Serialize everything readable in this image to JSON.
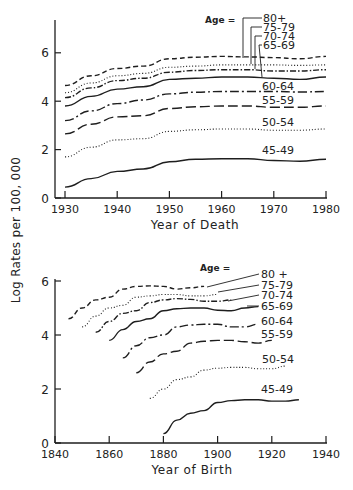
{
  "figure": {
    "ylabel": "Log Rates per 100, 000"
  },
  "chart_data": [
    {
      "type": "line",
      "title": "",
      "xlabel": "Year of Death",
      "ylabel": "Log Rates per 100, 000",
      "xlim": [
        1930,
        1980
      ],
      "ylim": [
        0,
        7.3
      ],
      "xticks": [
        1930,
        1940,
        1950,
        1960,
        1970,
        1980
      ],
      "yticks": [
        0,
        2,
        4,
        6
      ],
      "grid": false,
      "legend_title": "Age =",
      "series": [
        {
          "name": "80+",
          "style": "dashed",
          "x": [
            1930,
            1935,
            1940,
            1945,
            1950,
            1955,
            1960,
            1965,
            1970,
            1975,
            1980
          ],
          "y": [
            4.65,
            5.05,
            5.35,
            5.45,
            5.75,
            5.82,
            5.85,
            5.83,
            5.8,
            5.75,
            5.85
          ]
        },
        {
          "name": "75-79",
          "style": "dotted",
          "x": [
            1930,
            1935,
            1940,
            1945,
            1950,
            1955,
            1960,
            1965,
            1970,
            1975,
            1980
          ],
          "y": [
            4.35,
            4.75,
            5.05,
            5.15,
            5.4,
            5.45,
            5.5,
            5.5,
            5.5,
            5.48,
            5.5
          ]
        },
        {
          "name": "70-74",
          "style": "dashdot",
          "x": [
            1930,
            1935,
            1940,
            1945,
            1950,
            1955,
            1960,
            1965,
            1970,
            1975,
            1980
          ],
          "y": [
            4.15,
            4.55,
            4.85,
            4.95,
            5.2,
            5.27,
            5.3,
            5.3,
            5.25,
            5.25,
            5.3
          ]
        },
        {
          "name": "65-69",
          "style": "solid",
          "x": [
            1930,
            1935,
            1940,
            1945,
            1950,
            1955,
            1960,
            1965,
            1970,
            1975,
            1980
          ],
          "y": [
            3.8,
            4.2,
            4.5,
            4.6,
            4.9,
            4.95,
            5.0,
            5.0,
            4.95,
            4.9,
            5.0
          ]
        },
        {
          "name": "60-64",
          "style": "longdashdot",
          "x": [
            1930,
            1935,
            1940,
            1945,
            1950,
            1955,
            1960,
            1965,
            1970,
            1975,
            1980
          ],
          "y": [
            3.2,
            3.6,
            3.9,
            4.05,
            4.3,
            4.37,
            4.4,
            4.4,
            4.4,
            4.38,
            4.4
          ]
        },
        {
          "name": "55-59",
          "style": "longdash",
          "x": [
            1930,
            1935,
            1940,
            1945,
            1950,
            1955,
            1960,
            1965,
            1970,
            1975,
            1980
          ],
          "y": [
            2.65,
            3.05,
            3.35,
            3.4,
            3.7,
            3.77,
            3.8,
            3.8,
            3.75,
            3.75,
            3.8
          ]
        },
        {
          "name": "50-54",
          "style": "dotted",
          "x": [
            1930,
            1935,
            1940,
            1945,
            1950,
            1955,
            1960,
            1965,
            1970,
            1975,
            1980
          ],
          "y": [
            1.7,
            2.1,
            2.4,
            2.45,
            2.75,
            2.82,
            2.85,
            2.85,
            2.8,
            2.8,
            2.85
          ]
        },
        {
          "name": "45-49",
          "style": "solid",
          "x": [
            1930,
            1935,
            1940,
            1945,
            1950,
            1955,
            1960,
            1965,
            1970,
            1975,
            1980
          ],
          "y": [
            0.45,
            0.8,
            1.1,
            1.2,
            1.5,
            1.6,
            1.62,
            1.62,
            1.55,
            1.52,
            1.6
          ]
        }
      ]
    },
    {
      "type": "line",
      "title": "",
      "xlabel": "Year of Birth",
      "ylabel": "Log Rates per 100, 000",
      "xlim": [
        1840,
        1940
      ],
      "ylim": [
        0,
        6.1
      ],
      "xticks": [
        1840,
        1860,
        1880,
        1900,
        1920,
        1940
      ],
      "yticks": [
        0,
        2,
        4,
        6
      ],
      "grid": false,
      "legend_title": "Age =",
      "series": [
        {
          "name": "80 +",
          "style": "dashed",
          "x": [
            1845,
            1850,
            1855,
            1860,
            1865,
            1870,
            1875,
            1880,
            1885,
            1890,
            1895
          ],
          "y": [
            4.6,
            5.0,
            5.3,
            5.4,
            5.7,
            5.8,
            5.82,
            5.8,
            5.7,
            5.75,
            5.8
          ]
        },
        {
          "name": "75-79",
          "style": "dotted",
          "x": [
            1850,
            1855,
            1860,
            1865,
            1870,
            1875,
            1880,
            1885,
            1890,
            1895,
            1900
          ],
          "y": [
            4.3,
            4.7,
            5.0,
            5.1,
            5.4,
            5.45,
            5.5,
            5.5,
            5.45,
            5.45,
            5.5
          ]
        },
        {
          "name": "70-74",
          "style": "dashdot",
          "x": [
            1855,
            1860,
            1865,
            1870,
            1875,
            1880,
            1885,
            1890,
            1895,
            1900,
            1905
          ],
          "y": [
            4.1,
            4.5,
            4.8,
            4.9,
            5.2,
            5.3,
            5.35,
            5.32,
            5.25,
            5.25,
            5.3
          ]
        },
        {
          "name": "65-69",
          "style": "solid",
          "x": [
            1860,
            1865,
            1870,
            1875,
            1880,
            1885,
            1890,
            1895,
            1900,
            1905,
            1910,
            1915
          ],
          "y": [
            3.8,
            4.2,
            4.5,
            4.6,
            4.9,
            4.97,
            5.0,
            5.0,
            4.92,
            4.9,
            5.0,
            5.05
          ]
        },
        {
          "name": "60-64",
          "style": "longdashdot",
          "x": [
            1865,
            1870,
            1875,
            1880,
            1885,
            1890,
            1895,
            1900,
            1905,
            1910,
            1915
          ],
          "y": [
            3.15,
            3.6,
            3.9,
            4.0,
            4.3,
            4.37,
            4.4,
            4.4,
            4.3,
            4.3,
            4.4
          ]
        },
        {
          "name": "55-59",
          "style": "longdash",
          "x": [
            1870,
            1875,
            1880,
            1885,
            1890,
            1895,
            1900,
            1905,
            1910,
            1915,
            1920
          ],
          "y": [
            2.6,
            3.0,
            3.3,
            3.4,
            3.7,
            3.77,
            3.8,
            3.8,
            3.75,
            3.7,
            3.8
          ]
        },
        {
          "name": "50-54",
          "style": "dotted",
          "x": [
            1875,
            1880,
            1885,
            1890,
            1895,
            1900,
            1905,
            1910,
            1915,
            1920,
            1925
          ],
          "y": [
            1.65,
            2.0,
            2.35,
            2.45,
            2.7,
            2.77,
            2.8,
            2.8,
            2.75,
            2.75,
            2.85
          ]
        },
        {
          "name": "45-49",
          "style": "solid",
          "x": [
            1880,
            1885,
            1890,
            1895,
            1900,
            1905,
            1910,
            1915,
            1920,
            1925,
            1930
          ],
          "y": [
            0.35,
            0.85,
            1.1,
            1.2,
            1.5,
            1.57,
            1.6,
            1.6,
            1.55,
            1.55,
            1.6
          ]
        }
      ]
    }
  ],
  "layout": {
    "panels": [
      {
        "axis": {
          "x0": 55,
          "x1": 327,
          "y0": 198,
          "ytop": 20,
          "xmin_px": 65,
          "xmax_px": 326,
          "px_per_y": 24.2
        },
        "xlabel_pos": [
          195,
          229
        ],
        "legend_title_pos": [
          205,
          23
        ],
        "labels": [
          {
            "series": 0,
            "x": 263,
            "y": 22,
            "leader": [
              [
                262,
                18
              ],
              [
                243,
                18
              ],
              [
                243,
                58
              ]
            ]
          },
          {
            "series": 1,
            "x": 263,
            "y": 31,
            "leader": [
              [
                262,
                27
              ],
              [
                251,
                27
              ],
              [
                251,
                64
              ]
            ]
          },
          {
            "series": 2,
            "x": 263,
            "y": 40,
            "leader": [
              [
                262,
                36
              ],
              [
                255,
                36
              ],
              [
                255,
                69
              ]
            ]
          },
          {
            "series": 3,
            "x": 263,
            "y": 49,
            "leader": [
              [
                262,
                45
              ],
              [
                259,
                45
              ],
              [
                262,
                77
              ]
            ]
          },
          {
            "series": 4,
            "x": 262,
            "y": 90,
            "leader": null
          },
          {
            "series": 5,
            "x": 262,
            "y": 104,
            "leader": null
          },
          {
            "series": 6,
            "x": 262,
            "y": 126,
            "leader": null
          },
          {
            "series": 7,
            "x": 262,
            "y": 154,
            "leader": null
          }
        ]
      },
      {
        "axis": {
          "x0": 55,
          "x1": 327,
          "y0": 443,
          "ytop": 279,
          "xmin_px": 55,
          "xmax_px": 326,
          "px_per_y": 27.0
        },
        "xlabel_pos": [
          192,
          474
        ],
        "legend_title_pos": [
          200,
          271
        ],
        "labels": [
          {
            "series": 0,
            "x": 261,
            "y": 278,
            "leader": [
              [
                259,
                274
              ],
              [
                207,
                287
              ]
            ]
          },
          {
            "series": 1,
            "x": 261,
            "y": 289,
            "leader": [
              [
                259,
                285
              ],
              [
                218,
                292
              ]
            ]
          },
          {
            "series": 2,
            "x": 261,
            "y": 299,
            "leader": [
              [
                259,
                295
              ],
              [
                228,
                301
              ]
            ]
          },
          {
            "series": 3,
            "x": 261,
            "y": 310,
            "leader": [
              [
                259,
                306
              ],
              [
                247,
                306
              ]
            ]
          },
          {
            "series": 4,
            "x": 261,
            "y": 325,
            "leader": null
          },
          {
            "series": 5,
            "x": 261,
            "y": 338,
            "leader": null
          },
          {
            "series": 6,
            "x": 262,
            "y": 363,
            "leader": null
          },
          {
            "series": 7,
            "x": 261,
            "y": 393,
            "leader": null
          }
        ]
      }
    ],
    "line_color": "#1e1e1e",
    "dash_styles": {
      "solid": "",
      "dashed": "5 3",
      "dotted": "1 2",
      "dashdot": "6 2 1.5 2",
      "longdashdot": "9 3 2 3",
      "longdash": "10 4"
    }
  }
}
